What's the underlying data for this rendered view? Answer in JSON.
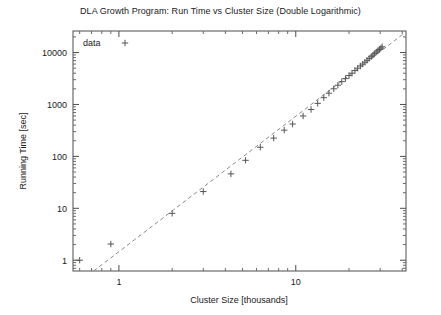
{
  "chart_data": {
    "type": "scatter",
    "title": "DLA Growth Program: Run Time vs Cluster Size (Double Logarithmic)",
    "xlabel": "Cluster Size [thousands]",
    "ylabel": "Running Time [sec]",
    "xscale": "log",
    "yscale": "log",
    "xlim": [
      0.55,
      42
    ],
    "ylim": [
      0.62,
      26000
    ],
    "xticks": [
      1,
      10
    ],
    "xtick_labels": [
      "1",
      "10"
    ],
    "yticks": [
      1,
      10,
      100,
      1000,
      10000
    ],
    "ytick_labels": [
      "1",
      "10",
      "100",
      "1000",
      "10000"
    ],
    "grid": false,
    "legend": {
      "position": "top-left-inside",
      "entries": [
        {
          "label": "data",
          "marker": "plus",
          "color": "#555555"
        }
      ]
    },
    "series": [
      {
        "name": "data",
        "marker": "plus",
        "color": "#555555",
        "points": [
          [
            0.6,
            1.0
          ],
          [
            0.9,
            2.05
          ],
          [
            2.0,
            8.0
          ],
          [
            3.0,
            21.0
          ],
          [
            4.3,
            46.0
          ],
          [
            5.2,
            84.0
          ],
          [
            6.3,
            150.0
          ],
          [
            7.5,
            225.0
          ],
          [
            8.6,
            320.0
          ],
          [
            9.6,
            420.0
          ],
          [
            11.0,
            600.0
          ],
          [
            12.2,
            800.0
          ],
          [
            13.3,
            1050.0
          ],
          [
            14.4,
            1350.0
          ],
          [
            15.4,
            1650.0
          ],
          [
            16.4,
            2000.0
          ],
          [
            17.3,
            2350.0
          ],
          [
            18.2,
            2750.0
          ],
          [
            19.1,
            3150.0
          ],
          [
            20.0,
            3600.0
          ],
          [
            20.8,
            4000.0
          ],
          [
            21.6,
            4500.0
          ],
          [
            22.4,
            5000.0
          ],
          [
            23.2,
            5500.0
          ],
          [
            23.9,
            6000.0
          ],
          [
            24.6,
            6500.0
          ],
          [
            25.3,
            7100.0
          ],
          [
            26.0,
            7700.0
          ],
          [
            26.7,
            8300.0
          ],
          [
            27.3,
            8900.0
          ],
          [
            27.9,
            9500.0
          ],
          [
            28.5,
            10200.0
          ],
          [
            29.1,
            10800.0
          ],
          [
            29.7,
            11500.0
          ],
          [
            30.3,
            12200.0
          ],
          [
            30.8,
            12900.0
          ]
        ]
      }
    ],
    "fit_line": {
      "name": "power-law fit",
      "style": "dashed",
      "color": "#8a8a8a",
      "x_start": 0.72,
      "y_start": 0.62,
      "x_end": 41.0,
      "y_end": 23500.0
    }
  }
}
